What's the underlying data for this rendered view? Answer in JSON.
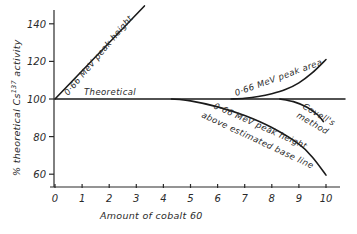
{
  "chart_data": {
    "type": "line",
    "title": "",
    "xlabel": "Amount of cobalt 60",
    "ylabel_prefix": "% theoretical Cs",
    "ylabel_sup": "137",
    "ylabel_suffix": " activity",
    "xlim": [
      0,
      10.7
    ],
    "ylim": [
      53,
      150
    ],
    "grid": false,
    "xticks": [
      0,
      1,
      2,
      3,
      4,
      5,
      6,
      7,
      8,
      9,
      10
    ],
    "xtick_labels": [
      "0",
      "1",
      "2",
      "3",
      "4",
      "5",
      "6",
      "7",
      "8",
      "9",
      "10"
    ],
    "yticks": [
      60,
      80,
      100,
      120,
      140
    ],
    "ytick_labels": [
      "60",
      "80",
      "100",
      "120",
      "140"
    ],
    "series": [
      {
        "name": "Theoretical",
        "x": [
          0,
          10.7
        ],
        "y": [
          100,
          100
        ]
      },
      {
        "name": "0·66 MeV peak height",
        "x": [
          0,
          3.3
        ],
        "y": [
          100,
          149.5
        ]
      },
      {
        "name": "0·66 MeV peak area",
        "x": [
          6.5,
          7.0,
          7.5,
          8.0,
          8.5,
          9.0,
          9.5,
          10.0
        ],
        "y": [
          100,
          100.4,
          101.3,
          102.8,
          105.0,
          108.6,
          114.0,
          121.0
        ]
      },
      {
        "name": "0·66 MeV peak height above estimated base line",
        "x": [
          4.3,
          5.0,
          6.0,
          7.0,
          8.0,
          9.0,
          9.5,
          10.0
        ],
        "y": [
          100,
          99.0,
          95.8,
          91.2,
          84.8,
          76.0,
          69.0,
          59.5
        ]
      },
      {
        "name": "Covell's method",
        "x": [
          8.3,
          8.8,
          9.3,
          9.7,
          9.9
        ],
        "y": [
          100,
          98.6,
          95.6,
          91.5,
          88.0
        ]
      }
    ],
    "annotations": [
      {
        "text": "0·66 MeV peak height",
        "series": 1
      },
      {
        "text": "Theoretical",
        "series": 0
      },
      {
        "text": "0·66 MeV peak area",
        "series": 2
      },
      {
        "text": "0·66 MeV peak height",
        "series": 3
      },
      {
        "text": "above estimated base line",
        "series": 3
      },
      {
        "text": "Covell's",
        "series": 4
      },
      {
        "text": "method",
        "series": 4
      }
    ]
  }
}
